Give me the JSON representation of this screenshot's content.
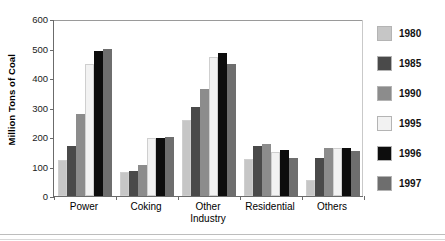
{
  "chart_data": {
    "type": "bar",
    "title": "",
    "xlabel": "",
    "ylabel": "Million Tons of Coal",
    "categories": [
      "Power",
      "Coking",
      "Other Industry",
      "Residential",
      "Others"
    ],
    "series": [
      {
        "name": "1980",
        "color": "#c6c6c6",
        "values": [
          122,
          80,
          257,
          125,
          55
        ]
      },
      {
        "name": "1985",
        "color": "#4a4a4a",
        "values": [
          171,
          85,
          301,
          168,
          130
        ]
      },
      {
        "name": "1990",
        "color": "#8c8c8c",
        "values": [
          278,
          105,
          364,
          177,
          162
        ]
      },
      {
        "name": "1995",
        "color": "#f2f2f2",
        "values": [
          446,
          195,
          471,
          150,
          162
        ]
      },
      {
        "name": "1996",
        "color": "#0d0d0d",
        "values": [
          493,
          197,
          485,
          155,
          162
        ]
      },
      {
        "name": "1997",
        "color": "#6e6e6e",
        "values": [
          497,
          200,
          449,
          130,
          152
        ]
      }
    ],
    "ylim": [
      0,
      600
    ],
    "yticks": [
      0,
      100,
      200,
      300,
      400,
      500,
      600
    ],
    "ytick_labels": [
      "0",
      "100",
      "200",
      "300",
      "400",
      "500",
      "600"
    ],
    "grid": false,
    "legend_position": "right"
  },
  "axis": {
    "y_title": "Million Tons of Coal"
  },
  "legend": {
    "entries": [
      "1980",
      "1985",
      "1990",
      "1995",
      "1996",
      "1997"
    ]
  },
  "x_labels": [
    {
      "line1": "Power",
      "line2": ""
    },
    {
      "line1": "Coking",
      "line2": ""
    },
    {
      "line1": "Other",
      "line2": "Industry"
    },
    {
      "line1": "Residential",
      "line2": ""
    },
    {
      "line1": "Others",
      "line2": ""
    }
  ],
  "colors": {
    "axis": "#6b6b6b",
    "text": "#000000",
    "background": "#ffffff"
  }
}
